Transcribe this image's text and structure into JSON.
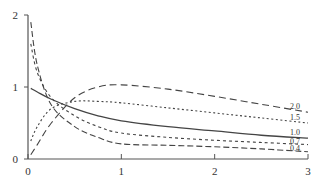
{
  "chart_data": {
    "type": "line",
    "title": "",
    "xlabel": "",
    "ylabel": "",
    "xlim": [
      0,
      3
    ],
    "ylim": [
      0,
      2
    ],
    "grid": false,
    "legend": "curve labels at right end",
    "x_ticks": [
      "0",
      "1",
      "2",
      "3"
    ],
    "y_ticks": [
      "0",
      "1",
      "2"
    ],
    "x": [
      0.03,
      0.1,
      0.25,
      0.5,
      0.75,
      1.0,
      1.5,
      2.0,
      2.5,
      3.0
    ],
    "series": [
      {
        "name": "2.0",
        "style": "long-dash",
        "values": [
          0.06,
          0.2,
          0.5,
          0.85,
          1.0,
          1.03,
          0.97,
          0.87,
          0.76,
          0.65
        ]
      },
      {
        "name": "1.5",
        "style": "dotted",
        "values": [
          0.25,
          0.45,
          0.7,
          0.8,
          0.8,
          0.78,
          0.71,
          0.64,
          0.57,
          0.5
        ]
      },
      {
        "name": "1.0",
        "style": "solid",
        "values": [
          0.98,
          0.93,
          0.83,
          0.7,
          0.6,
          0.53,
          0.45,
          0.39,
          0.33,
          0.29
        ]
      },
      {
        "name": "0.7",
        "style": "short-dash",
        "values": [
          1.6,
          1.2,
          0.85,
          0.6,
          0.45,
          0.36,
          0.3,
          0.26,
          0.23,
          0.2
        ]
      },
      {
        "name": "0.4",
        "style": "dash",
        "values": [
          1.9,
          1.3,
          0.75,
          0.45,
          0.3,
          0.21,
          0.19,
          0.17,
          0.14,
          0.1
        ]
      }
    ]
  }
}
